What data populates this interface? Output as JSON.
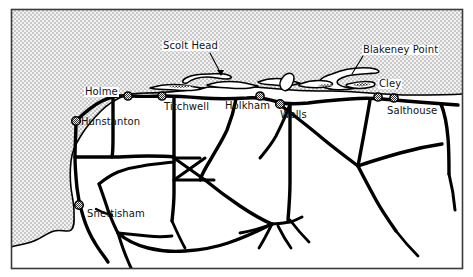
{
  "map": {
    "title": "North Norfolk coast map",
    "frame_color": "#3a3a3a",
    "sea_color": "#d4d4d4",
    "land_color": "#ffffff",
    "road_color": "#000000",
    "label_text_color": "#111111",
    "label_box_color": "#ffffff",
    "marker_fill": "#9a9a9a",
    "marker_stroke": "#000000",
    "places": [
      {
        "name": "Holme",
        "label": "Holme",
        "boxed": true,
        "marker": true,
        "marker_x": 128,
        "marker_y": 96
      },
      {
        "name": "Hunstanton",
        "label": "Hunstanton",
        "boxed": false,
        "marker": true,
        "marker_x": 76,
        "marker_y": 121
      },
      {
        "name": "Titchwell",
        "label": "Titchwell",
        "boxed": false,
        "marker": true,
        "marker_x": 162,
        "marker_y": 96
      },
      {
        "name": "Holkham",
        "label": "Holkham",
        "boxed": false,
        "marker": true,
        "marker_x": 260,
        "marker_y": 96
      },
      {
        "name": "Wells",
        "label": "Wells",
        "boxed": false,
        "marker": true,
        "marker_x": 280,
        "marker_y": 104
      },
      {
        "name": "Cley",
        "label": "Cley",
        "boxed": true,
        "marker": true,
        "marker_x": 378,
        "marker_y": 97
      },
      {
        "name": "Salthouse",
        "label": "Salthouse",
        "boxed": true,
        "marker": true,
        "marker_x": 394,
        "marker_y": 98
      },
      {
        "name": "Snettisham",
        "label": "Snettisham",
        "boxed": false,
        "marker": true,
        "marker_x": 79,
        "marker_y": 205
      }
    ],
    "features": [
      {
        "name": "Scolt Head",
        "label": "Scolt Head",
        "boxed": true,
        "leader": true
      },
      {
        "name": "Blakeney Point",
        "label": "Blakeney Point",
        "boxed": true,
        "leader": true
      }
    ]
  }
}
